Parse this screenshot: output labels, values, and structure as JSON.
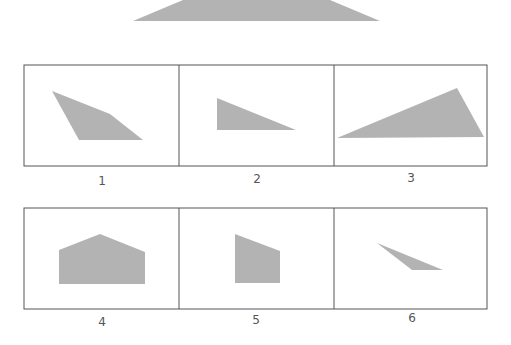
{
  "fill_color": "#b3b3b3",
  "border_color": "#555555",
  "reference_shape": {
    "points": "133,21 183,0 330,0 380,21"
  },
  "options": [
    {
      "label": "1",
      "points": "52,91 110,114 143,140 79,140"
    },
    {
      "label": "2",
      "points": "217,98 296,130 217,130"
    },
    {
      "label": "3",
      "points": "337,138 457,88 484,137"
    },
    {
      "label": "4",
      "points": "59,250 100,234 145,252 145,284 59,284"
    },
    {
      "label": "5",
      "points": "235,234 280,251 280,283 235,283"
    },
    {
      "label": "6",
      "points": "377,243 412,270 443,270"
    }
  ]
}
